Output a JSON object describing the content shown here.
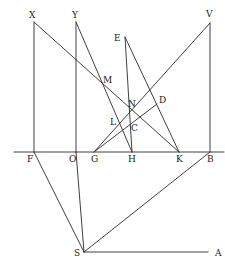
{
  "diagram": {
    "stroke_color": "#2a2a2a",
    "points": {
      "X": {
        "x": 34,
        "y": 22,
        "lx": 29,
        "ly": 18,
        "label": "X"
      },
      "Y": {
        "x": 76,
        "y": 22,
        "lx": 72,
        "ly": 18,
        "label": "Y"
      },
      "V": {
        "x": 210,
        "y": 23,
        "lx": 206,
        "ly": 17,
        "label": "V"
      },
      "E": {
        "x": 125,
        "y": 37,
        "lx": 114,
        "ly": 41,
        "label": "E"
      },
      "M": {
        "x": 102,
        "y": 84,
        "lx": 103,
        "ly": 83,
        "label": "M"
      },
      "N": {
        "x": 130,
        "y": 108,
        "lx": 128,
        "ly": 107,
        "label": "N"
      },
      "D": {
        "x": 157,
        "y": 104,
        "lx": 159,
        "ly": 103,
        "label": "D"
      },
      "L": {
        "x": 118,
        "y": 124,
        "lx": 110,
        "ly": 125,
        "label": "L"
      },
      "C": {
        "x": 133,
        "y": 128,
        "lx": 131,
        "ly": 131,
        "label": "C"
      },
      "F": {
        "x": 34,
        "y": 152,
        "lx": 27,
        "ly": 162,
        "label": "F"
      },
      "O": {
        "x": 76,
        "y": 152,
        "lx": 69,
        "ly": 162,
        "label": "O"
      },
      "G": {
        "x": 94,
        "y": 152,
        "lx": 91,
        "ly": 162,
        "label": "G"
      },
      "H": {
        "x": 132,
        "y": 152,
        "lx": 128,
        "ly": 162,
        "label": "H"
      },
      "K": {
        "x": 179,
        "y": 152,
        "lx": 176,
        "ly": 162,
        "label": "K"
      },
      "B": {
        "x": 210,
        "y": 152,
        "lx": 207,
        "ly": 162,
        "label": "B"
      },
      "S": {
        "x": 84,
        "y": 252,
        "lx": 74,
        "ly": 256,
        "label": "S"
      },
      "A": {
        "x": 208,
        "y": 252,
        "lx": 215,
        "ly": 256,
        "label": "A"
      }
    },
    "segments": [
      {
        "from": [
          14,
          152
        ],
        "to": [
          224,
          152
        ],
        "name": "baseline-FB"
      },
      {
        "from": "X",
        "to": "F",
        "name": "line-XF"
      },
      {
        "from": "Y",
        "to": "O",
        "name": "line-YO"
      },
      {
        "from": "O",
        "to": "S",
        "name": "line-OS"
      },
      {
        "from": "V",
        "to": "B",
        "name": "line-VB"
      },
      {
        "from": "X",
        "to": "K",
        "name": "line-XK"
      },
      {
        "from": "Y",
        "to": "H",
        "name": "line-YH"
      },
      {
        "from": "E",
        "to": "H",
        "name": "line-EH"
      },
      {
        "from": "E",
        "to": "K",
        "name": "line-EK"
      },
      {
        "from": "V",
        "to": "G",
        "name": "line-VG"
      },
      {
        "from": "G",
        "to": "D",
        "name": "line-GD"
      },
      {
        "from": "F",
        "to": "S",
        "name": "line-FS"
      },
      {
        "from": "B",
        "to": "S",
        "name": "line-BS"
      },
      {
        "from": "S",
        "to": "A",
        "name": "line-SA"
      }
    ]
  }
}
